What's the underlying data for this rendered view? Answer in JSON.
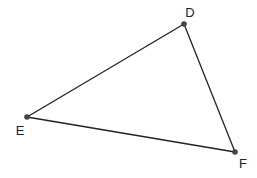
{
  "diagram": {
    "type": "triangle",
    "stroke_color": "#222222",
    "point_color": "#444444",
    "vertices": [
      {
        "label": "D",
        "x": 184,
        "y": 24,
        "label_x": 190,
        "label_y": 17
      },
      {
        "label": "E",
        "x": 27,
        "y": 117,
        "label_x": 20,
        "label_y": 135
      },
      {
        "label": "F",
        "x": 235,
        "y": 152,
        "label_x": 243,
        "label_y": 168
      }
    ],
    "edges": [
      [
        "D",
        "E"
      ],
      [
        "E",
        "F"
      ],
      [
        "F",
        "D"
      ]
    ]
  }
}
